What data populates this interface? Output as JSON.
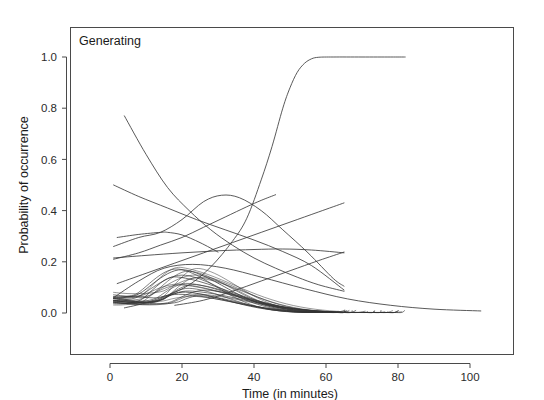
{
  "figure": {
    "panel_label": "Generating",
    "background_color": "#ffffff",
    "line_color": "#3c3c3c",
    "frame_color": "#4a4a4a"
  },
  "axes": {
    "x_title": "Time (in minutes)",
    "y_title": "Probability of occurrence",
    "x_ticks": [
      "0",
      "20",
      "40",
      "60",
      "80",
      "100"
    ],
    "y_ticks": [
      "0.0",
      "0.2",
      "0.4",
      "0.6",
      "0.8",
      "1.0"
    ]
  },
  "chart_data": {
    "type": "line",
    "title": "Generating",
    "xlabel": "Time (in minutes)",
    "ylabel": "Probability of occurrence",
    "xlim": [
      -10,
      113
    ],
    "ylim": [
      -0.08,
      1.1
    ],
    "x_ticks": [
      0,
      20,
      40,
      60,
      80,
      100
    ],
    "y_ticks": [
      0.0,
      0.2,
      0.4,
      0.6,
      0.8,
      1.0
    ],
    "grid": false,
    "legend": "none",
    "annotations": [
      {
        "text": "Generating",
        "x": 2,
        "y": 1.07,
        "position": "top-left-inside-panel"
      }
    ],
    "series": [
      {
        "name": "sigmoid-to-one",
        "comment": "rises steeply between t=40 and t=55 then plateaus at 1.0 until t=82",
        "x": [
          4,
          10,
          16,
          22,
          28,
          34,
          38,
          42,
          45,
          48,
          50,
          52,
          54,
          56,
          58,
          62,
          70,
          78,
          82
        ],
        "y": [
          0.02,
          0.04,
          0.07,
          0.11,
          0.18,
          0.28,
          0.37,
          0.52,
          0.65,
          0.8,
          0.88,
          0.94,
          0.975,
          0.993,
          0.999,
          1.0,
          1.0,
          1.0,
          1.0
        ]
      },
      {
        "name": "steep-decline-from-077",
        "comment": "starts at 0.77 near t=4 and falls monotonically to ~0.08 at t=65",
        "x": [
          4,
          10,
          16,
          22,
          28,
          34,
          40,
          46,
          52,
          58,
          65
        ],
        "y": [
          0.77,
          0.62,
          0.49,
          0.4,
          0.325,
          0.265,
          0.215,
          0.175,
          0.14,
          0.11,
          0.085
        ]
      },
      {
        "name": "slow-decline-from-050",
        "comment": "begins 0.50 at t=1, declines gently, crosses 0.25 near t=46, ends 0.085 at t=65",
        "x": [
          1,
          8,
          16,
          24,
          32,
          40,
          48,
          56,
          65
        ],
        "y": [
          0.5,
          0.455,
          0.41,
          0.365,
          0.325,
          0.285,
          0.24,
          0.185,
          0.09
        ]
      },
      {
        "name": "hump-peak-046-at-t31",
        "comment": "rises from 0.26 to a rounded maximum of 0.46 near t=31 then falls to 0.09 at t=65",
        "x": [
          1,
          8,
          14,
          20,
          26,
          31,
          36,
          42,
          48,
          55,
          62,
          65
        ],
        "y": [
          0.26,
          0.295,
          0.315,
          0.365,
          0.435,
          0.46,
          0.45,
          0.4,
          0.325,
          0.235,
          0.135,
          0.105
        ]
      },
      {
        "name": "rise-to-046-at-t46",
        "comment": "monotone rise from 0.21 at t=1 to 0.46 ending at t=46",
        "x": [
          1,
          8,
          14,
          20,
          26,
          32,
          38,
          42,
          46
        ],
        "y": [
          0.21,
          0.235,
          0.265,
          0.295,
          0.335,
          0.375,
          0.415,
          0.44,
          0.462
        ]
      },
      {
        "name": "rise-to-043-at-t65",
        "comment": "slow concave rise from 0.11 at t=2 to 0.43 at t=65",
        "x": [
          2,
          10,
          18,
          26,
          34,
          42,
          50,
          58,
          65
        ],
        "y": [
          0.115,
          0.155,
          0.195,
          0.235,
          0.275,
          0.315,
          0.355,
          0.395,
          0.43
        ]
      },
      {
        "name": "shallow-rise-to-024-at-t65",
        "comment": "low shallow rise from 0.03 at t=18 to 0.24 at t=65",
        "x": [
          18,
          26,
          34,
          42,
          50,
          58,
          65
        ],
        "y": [
          0.03,
          0.05,
          0.085,
          0.125,
          0.165,
          0.205,
          0.238
        ]
      },
      {
        "name": "flat-plateau-near-025",
        "comment": "rises from 0.215 to a broad flat plateau of ~0.25 then eases to 0.235 at t=65",
        "x": [
          1,
          10,
          20,
          30,
          40,
          48,
          56,
          65
        ],
        "y": [
          0.215,
          0.225,
          0.235,
          0.243,
          0.248,
          0.25,
          0.246,
          0.235
        ]
      },
      {
        "name": "flat-near-030",
        "comment": "starts 0.295 at t=2, small bump to 0.315 near t=16, decays to 0.235 at t=30",
        "x": [
          2,
          8,
          14,
          16,
          20,
          25,
          30
        ],
        "y": [
          0.295,
          0.307,
          0.315,
          0.315,
          0.305,
          0.275,
          0.238
        ]
      },
      {
        "name": "long-tail-decline",
        "comment": "broad low hump peaking 0.19 near t=23 with a long tail reaching 0.008 at t=103",
        "x": [
          1,
          8,
          15,
          23,
          32,
          42,
          54,
          66,
          78,
          90,
          103
        ],
        "y": [
          0.06,
          0.125,
          0.175,
          0.19,
          0.175,
          0.14,
          0.095,
          0.055,
          0.03,
          0.015,
          0.008
        ]
      }
    ],
    "bundle": {
      "name": "low-amplitude-bundle",
      "count": 22,
      "comment": "dense bundle of unimodal curves, peaks between 0.05 and 0.19 occurring at t=18-27, all decaying to ~0.00-0.01 by t=65-80",
      "peak_range": [
        0.05,
        0.19
      ],
      "peak_time_range": [
        18,
        27
      ],
      "start_range": [
        0.02,
        0.12
      ],
      "end_time_range": [
        62,
        82
      ]
    }
  }
}
